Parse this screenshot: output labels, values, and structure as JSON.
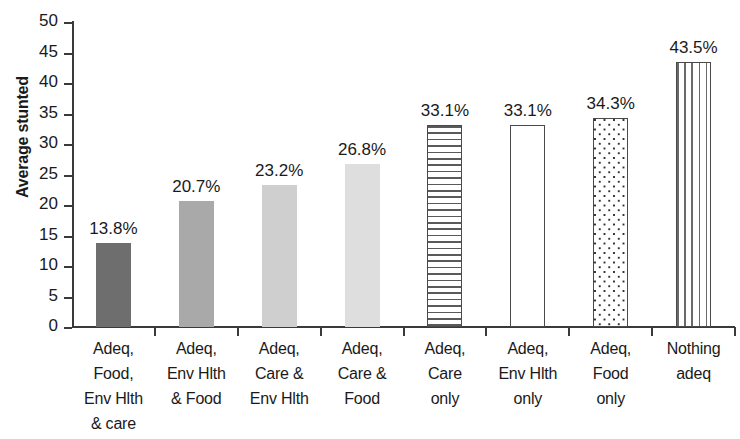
{
  "chart_data": {
    "type": "bar",
    "title": "",
    "subtitle": "",
    "xlabel": "",
    "ylabel": "Average stunted",
    "ylim": [
      0,
      50
    ],
    "ytick_step": 5,
    "yticks": [
      "50",
      "45",
      "40",
      "35",
      "30",
      "25",
      "20",
      "15",
      "10",
      "5",
      "0"
    ],
    "ytick_values": [
      50,
      45,
      40,
      35,
      30,
      25,
      20,
      15,
      10,
      5,
      0
    ],
    "grid": false,
    "legend": "none",
    "categories": [
      "Adeq, Food, Env Hlth & care",
      "Adeq, Env Hlth & Food",
      "Adeq, Care & Env Hlth",
      "Adeq, Care & Food",
      "Adeq, Care only",
      "Adeq, Env Hlth only",
      "Adeq, Food only",
      "Nothing adeq"
    ],
    "category_lines": [
      [
        "Adeq,",
        "Food,",
        "Env Hlth",
        "& care"
      ],
      [
        "Adeq,",
        "Env Hlth",
        "& Food"
      ],
      [
        "Adeq,",
        "Care &",
        "Env Hlth"
      ],
      [
        "Adeq,",
        "Care &",
        "Food"
      ],
      [
        "Adeq,",
        "Care",
        "only"
      ],
      [
        "Adeq,",
        "Env Hlth",
        "only"
      ],
      [
        "Adeq,",
        "Food",
        "only"
      ],
      [
        "Nothing",
        "adeq"
      ]
    ],
    "values": [
      13.8,
      20.7,
      23.2,
      26.8,
      33.1,
      33.1,
      34.3,
      43.5
    ],
    "data_labels": [
      "13.8%",
      "20.7%",
      "23.2%",
      "26.8%",
      "33.1%",
      "33.1%",
      "34.3%",
      "43.5%"
    ],
    "bar_styles": [
      "solid",
      "solid",
      "solid",
      "solid",
      "hlines",
      "outline",
      "dots",
      "vlines"
    ],
    "bar_colors": [
      "#6e6e6e",
      "#a9a9a9",
      "#cfcfcf",
      "#dedede",
      "#ffffff",
      "#ffffff",
      "#ffffff",
      "#ffffff"
    ],
    "axis_color": "#3a3a3a"
  }
}
